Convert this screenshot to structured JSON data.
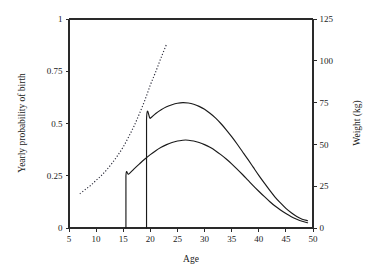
{
  "chart_data": {
    "type": "line",
    "title": "",
    "subtitle": "",
    "xlabel": "Age",
    "ylabel": "Yearly probability of birth",
    "y2label": "Weight (kg)",
    "xlim": [
      5,
      50
    ],
    "ylim": [
      0,
      1
    ],
    "y2lim": [
      0,
      125
    ],
    "grid": false,
    "legend": "none",
    "frame": "box-left-top-right-bottom",
    "xticks": [
      5,
      10,
      15,
      20,
      25,
      30,
      35,
      40,
      45,
      50
    ],
    "xticklabels": [
      "5",
      "10",
      "15",
      "20",
      "25",
      "30",
      "35",
      "40",
      "45",
      "50"
    ],
    "yticks": [
      0,
      0.25,
      0.5,
      0.75,
      1
    ],
    "yticklabels": [
      "0",
      "0.25",
      "0.5",
      "0.75",
      "1"
    ],
    "y2ticks": [
      0,
      25,
      50,
      75,
      100,
      125
    ],
    "y2ticklabels": [
      "0",
      "25",
      "50",
      "75",
      "100",
      "125"
    ],
    "series": [
      {
        "name": "weight-curve",
        "axis": "right",
        "style": "dotted",
        "color": "#2b2b3a",
        "x": [
          7,
          8,
          9,
          10,
          11,
          12,
          13,
          14,
          15,
          16,
          17,
          18,
          19,
          20,
          21,
          22,
          23
        ],
        "values": [
          20.5,
          23.0,
          25.5,
          28.5,
          31.5,
          35.0,
          39.0,
          43.5,
          48.5,
          54.5,
          61.0,
          68.5,
          76.5,
          85.5,
          93.5,
          102.0,
          110.0
        ]
      },
      {
        "name": "birth-probability-upper",
        "axis": "left",
        "style": "solid",
        "color": "#1a1a1a",
        "x": [
          19.3,
          19.3,
          20,
          21,
          22,
          23,
          24,
          25,
          26,
          27,
          28,
          29,
          30,
          31,
          32,
          33,
          34,
          35,
          36,
          37,
          38,
          39,
          40,
          41,
          42,
          43,
          44,
          45,
          46,
          47,
          48,
          49
        ],
        "values": [
          0.0,
          0.52,
          0.525,
          0.548,
          0.566,
          0.58,
          0.59,
          0.597,
          0.6,
          0.598,
          0.592,
          0.582,
          0.568,
          0.549,
          0.527,
          0.5,
          0.47,
          0.437,
          0.402,
          0.365,
          0.328,
          0.29,
          0.252,
          0.216,
          0.181,
          0.148,
          0.12,
          0.094,
          0.073,
          0.055,
          0.042,
          0.035
        ]
      },
      {
        "name": "birth-probability-lower",
        "axis": "left",
        "style": "solid",
        "color": "#1a1a1a",
        "x": [
          15.5,
          15.5,
          16,
          17,
          18,
          19,
          20,
          21,
          22,
          23,
          24,
          25,
          26,
          26.5,
          27,
          28,
          29,
          30,
          31,
          32,
          33,
          34,
          35,
          36,
          37,
          38,
          39,
          40,
          41,
          42,
          43,
          44,
          45,
          46,
          47,
          48,
          49
        ],
        "values": [
          0.0,
          0.25,
          0.258,
          0.283,
          0.307,
          0.33,
          0.351,
          0.37,
          0.386,
          0.399,
          0.409,
          0.416,
          0.42,
          0.421,
          0.42,
          0.416,
          0.409,
          0.399,
          0.386,
          0.37,
          0.351,
          0.33,
          0.307,
          0.282,
          0.256,
          0.229,
          0.202,
          0.176,
          0.151,
          0.127,
          0.105,
          0.086,
          0.069,
          0.054,
          0.042,
          0.032,
          0.025
        ]
      }
    ]
  },
  "axes": {
    "xlabel": "Age",
    "ylabel": "Yearly probability of birth",
    "y2label": "Weight (kg)"
  }
}
